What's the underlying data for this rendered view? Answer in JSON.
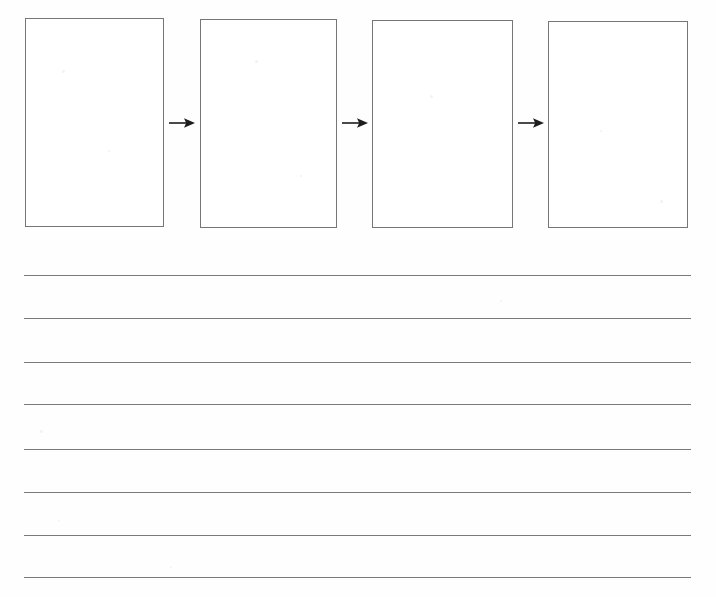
{
  "document": {
    "type": "worksheet",
    "title": "Sequence Flow Worksheet",
    "background_color": "#fefefe",
    "width": 716,
    "height": 597
  },
  "flow": {
    "name": "sequence-flow-diagram",
    "box_count": 4,
    "arrow_count": 3,
    "stroke_color": "#767676",
    "fill_color": "#ffffff",
    "boxes": [
      {
        "id": "box-1",
        "label": "",
        "x": 25,
        "y": 18,
        "width": 139,
        "height": 209
      },
      {
        "id": "box-2",
        "label": "",
        "x": 200,
        "y": 19,
        "width": 137,
        "height": 209
      },
      {
        "id": "box-3",
        "label": "",
        "x": 372,
        "y": 20,
        "width": 141,
        "height": 208
      },
      {
        "id": "box-4",
        "label": "",
        "x": 548,
        "y": 21,
        "width": 140,
        "height": 207
      }
    ],
    "arrows": [
      {
        "id": "arrow-1",
        "glyph": "right-arrow",
        "x": 168,
        "y": 116,
        "width": 28,
        "height": 14
      },
      {
        "id": "arrow-2",
        "glyph": "right-arrow",
        "x": 341,
        "y": 116,
        "width": 28,
        "height": 14
      },
      {
        "id": "arrow-3",
        "glyph": "right-arrow",
        "x": 517,
        "y": 116,
        "width": 28,
        "height": 14
      }
    ]
  },
  "writing_area": {
    "name": "ruled-writing-lines",
    "line_count": 8,
    "stroke_color": "#7a7a7a",
    "left": 24,
    "right": 691,
    "lines": [
      {
        "id": "rule-line-1",
        "text": "",
        "y": 275
      },
      {
        "id": "rule-line-2",
        "text": "",
        "y": 318
      },
      {
        "id": "rule-line-3",
        "text": "",
        "y": 362
      },
      {
        "id": "rule-line-4",
        "text": "",
        "y": 404
      },
      {
        "id": "rule-line-5",
        "text": "",
        "y": 449
      },
      {
        "id": "rule-line-6",
        "text": "",
        "y": 492
      },
      {
        "id": "rule-line-7",
        "text": "",
        "y": 535
      },
      {
        "id": "rule-line-8",
        "text": "",
        "y": 577
      }
    ]
  },
  "speckles": [
    {
      "x": 62,
      "y": 70,
      "size": 3
    },
    {
      "x": 108,
      "y": 150,
      "size": 2
    },
    {
      "x": 255,
      "y": 60,
      "size": 3
    },
    {
      "x": 300,
      "y": 175,
      "size": 2
    },
    {
      "x": 430,
      "y": 95,
      "size": 3
    },
    {
      "x": 600,
      "y": 130,
      "size": 2
    },
    {
      "x": 660,
      "y": 200,
      "size": 3
    },
    {
      "x": 40,
      "y": 430,
      "size": 3
    },
    {
      "x": 58,
      "y": 520,
      "size": 2
    },
    {
      "x": 170,
      "y": 566,
      "size": 2
    },
    {
      "x": 500,
      "y": 300,
      "size": 2
    }
  ]
}
